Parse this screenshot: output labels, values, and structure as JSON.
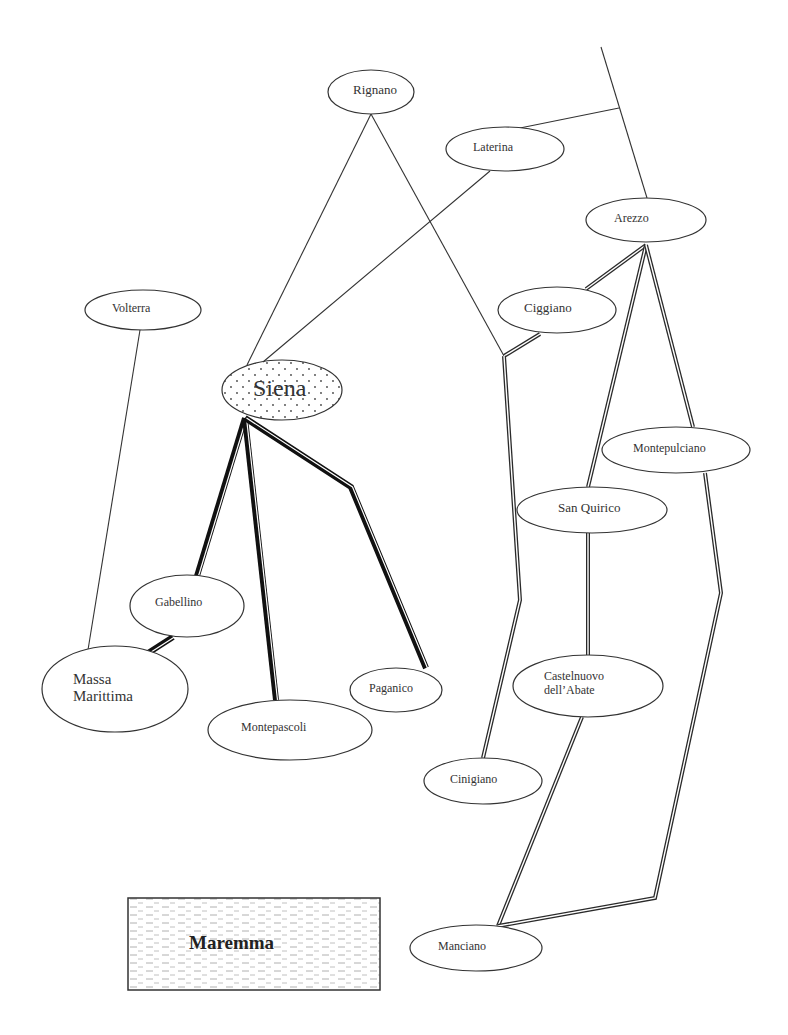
{
  "diagram": {
    "nodes": [
      {
        "id": "rignano",
        "label": "Rignano",
        "cx": 371,
        "cy": 92,
        "rx": 43,
        "ry": 22,
        "fs": 13,
        "lx": 353,
        "ly": 83
      },
      {
        "id": "laterina",
        "label": "Laterina",
        "cx": 505,
        "cy": 149,
        "rx": 59,
        "ry": 22,
        "fs": 12,
        "lx": 473,
        "ly": 141
      },
      {
        "id": "arezzo",
        "label": "Arezzo",
        "cx": 646,
        "cy": 220,
        "rx": 60,
        "ry": 22,
        "fs": 12,
        "lx": 614,
        "ly": 212
      },
      {
        "id": "volterra",
        "label": "Volterra",
        "cx": 143,
        "cy": 310,
        "rx": 58,
        "ry": 20,
        "fs": 12,
        "lx": 112,
        "ly": 302
      },
      {
        "id": "ciggiano",
        "label": "Ciggiano",
        "cx": 557,
        "cy": 310,
        "rx": 59,
        "ry": 23,
        "fs": 13,
        "lx": 524,
        "ly": 301
      },
      {
        "id": "siena",
        "label": "Siena",
        "cx": 282,
        "cy": 390,
        "rx": 60,
        "ry": 30,
        "fs": 24,
        "lx": 253,
        "ly": 375,
        "dotted": true
      },
      {
        "id": "montepulciano",
        "label": "Montepulciano",
        "cx": 676,
        "cy": 450,
        "rx": 74,
        "ry": 23,
        "fs": 12,
        "lx": 633,
        "ly": 442
      },
      {
        "id": "san_quirico",
        "label": "San Quirico",
        "cx": 592,
        "cy": 510,
        "rx": 75,
        "ry": 23,
        "fs": 13,
        "lx": 558,
        "ly": 501
      },
      {
        "id": "gabellino",
        "label": "Gabellino",
        "cx": 187,
        "cy": 606,
        "rx": 57,
        "ry": 31,
        "fs": 12,
        "lx": 155,
        "ly": 596
      },
      {
        "id": "castelnuovo",
        "label": "Castelnuovo\ndell’Abate",
        "cx": 588,
        "cy": 686,
        "rx": 75,
        "ry": 31,
        "fs": 12,
        "lx": 544,
        "ly": 670
      },
      {
        "id": "paganico",
        "label": "Paganico",
        "cx": 396,
        "cy": 690,
        "rx": 46,
        "ry": 22,
        "fs": 12,
        "lx": 369,
        "ly": 682
      },
      {
        "id": "massa",
        "label": "Massa\nMarittima",
        "cx": 115,
        "cy": 689,
        "rx": 73,
        "ry": 43,
        "fs": 15,
        "lx": 73,
        "ly": 671
      },
      {
        "id": "montepascoli",
        "label": "Montepascoli",
        "cx": 290,
        "cy": 730,
        "rx": 82,
        "ry": 30,
        "fs": 12,
        "lx": 241,
        "ly": 721
      },
      {
        "id": "cinigiano",
        "label": "Cinigiano",
        "cx": 483,
        "cy": 781,
        "rx": 59,
        "ry": 23,
        "fs": 12,
        "lx": 450,
        "ly": 773
      },
      {
        "id": "manciano",
        "label": "Manciano",
        "cx": 476,
        "cy": 948,
        "rx": 66,
        "ry": 23,
        "fs": 12,
        "lx": 438,
        "ly": 940
      }
    ],
    "thin_edges": [
      {
        "from": "rignano",
        "points": [
          [
            371,
            114
          ],
          [
            247,
            365
          ]
        ]
      },
      {
        "from": "rignano",
        "points": [
          [
            371,
            114
          ],
          [
            504,
            356
          ]
        ]
      },
      {
        "from": "laterina",
        "points": [
          [
            490,
            171
          ],
          [
            263,
            362
          ]
        ]
      },
      {
        "from": "laterina",
        "points": [
          [
            520,
            128
          ],
          [
            619,
            108
          ]
        ]
      },
      {
        "from": "arezzo",
        "points": [
          [
            601,
            47
          ],
          [
            647,
            198
          ]
        ]
      },
      {
        "from": "volterra",
        "points": [
          [
            140,
            330
          ],
          [
            87,
            656
          ]
        ]
      }
    ],
    "heavy_edges": [
      {
        "from": "siena",
        "to": "gabellino",
        "points": [
          [
            245,
            418
          ],
          [
            197,
            576
          ]
        ]
      },
      {
        "from": "siena",
        "to": "montepascoli",
        "points": [
          [
            245,
            418
          ],
          [
            276,
            700
          ]
        ]
      },
      {
        "from": "siena",
        "to": "paganico",
        "points": [
          [
            245,
            418
          ],
          [
            351,
            487
          ],
          [
            426,
            668
          ]
        ]
      },
      {
        "from": "gabellino",
        "to": "massa",
        "points": [
          [
            173,
            637
          ],
          [
            145,
            655
          ]
        ]
      }
    ],
    "double_edges": [
      {
        "from": "arezzo",
        "to": "ciggiano",
        "points": [
          [
            646,
            245
          ],
          [
            586,
            289
          ]
        ]
      },
      {
        "from": "ciggiano",
        "to": "junction",
        "points": [
          [
            540,
            334
          ],
          [
            504,
            356
          ]
        ]
      },
      {
        "from": "junction",
        "to": "cinigiano",
        "points": [
          [
            504,
            356
          ],
          [
            520,
            600
          ],
          [
            483,
            758
          ]
        ]
      },
      {
        "from": "arezzo",
        "to": "san_quirico",
        "points": [
          [
            646,
            245
          ],
          [
            588,
            487
          ]
        ]
      },
      {
        "from": "san_quirico",
        "to": "castelnuovo",
        "points": [
          [
            588,
            533
          ],
          [
            588,
            655
          ]
        ]
      },
      {
        "from": "castelnuovo",
        "to": "manciano",
        "points": [
          [
            582,
            717
          ],
          [
            498,
            926
          ]
        ]
      },
      {
        "from": "arezzo",
        "to": "montepulciano",
        "points": [
          [
            646,
            245
          ],
          [
            693,
            427
          ]
        ]
      },
      {
        "from": "montepulciano",
        "to": "manciano",
        "points": [
          [
            705,
            473
          ],
          [
            721,
            593
          ],
          [
            655,
            898
          ],
          [
            498,
            926
          ]
        ]
      }
    ],
    "region": {
      "label": "Maremma",
      "x": 128,
      "y": 898,
      "w": 252,
      "h": 92
    }
  }
}
